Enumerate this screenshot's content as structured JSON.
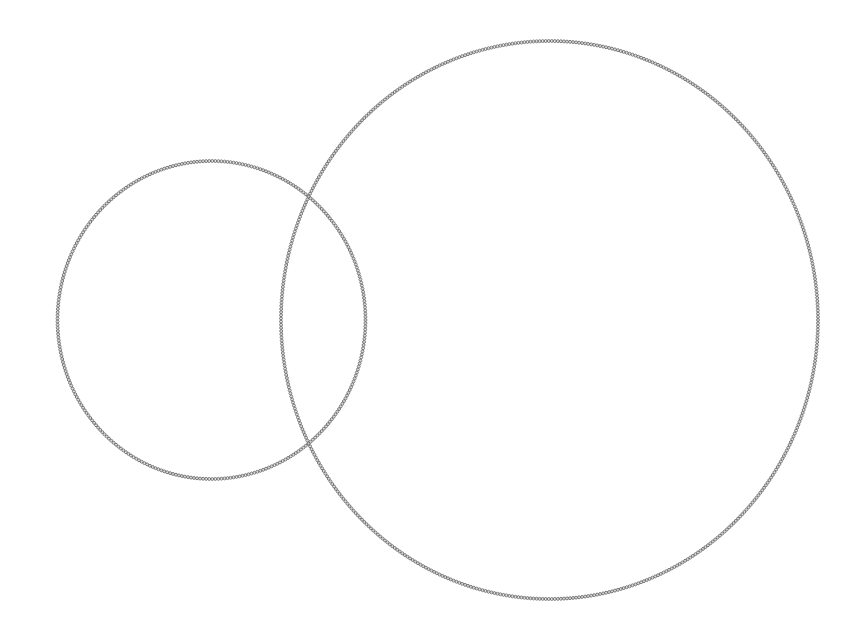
{
  "diagram": {
    "title": "",
    "shapes": [
      {
        "id": "small-circle",
        "kind": "circle",
        "label": "",
        "stroke_style": "beaded"
      },
      {
        "id": "large-circle",
        "kind": "circle",
        "label": "",
        "stroke_style": "beaded"
      }
    ],
    "relationship": "overlapping",
    "colors": {
      "background": "#ffffff",
      "stroke": "#6b6b6b"
    }
  }
}
